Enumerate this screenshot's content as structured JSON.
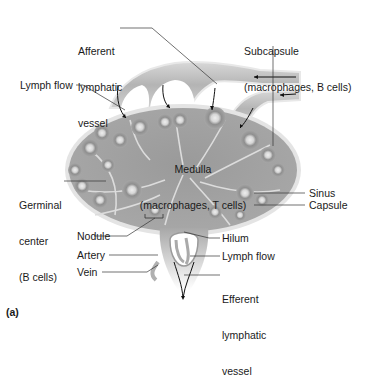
{
  "figure": {
    "panel_label": "(a)"
  },
  "labels": {
    "afferent": [
      "Afferent",
      "lymphatic",
      "vessel"
    ],
    "subcapsule": [
      "Subcapsule",
      "(macrophages, B cells)"
    ],
    "lymph_flow_top": "Lymph flow",
    "medulla": [
      "Medulla",
      "(macrophages, T cells)"
    ],
    "germinal": [
      "Germinal",
      "center",
      "(B cells)"
    ],
    "sinus": "Sinus",
    "capsule": "Capsule",
    "nodule": "Nodule",
    "hilum": "Hilum",
    "artery": "Artery",
    "lymph_flow_bottom": "Lymph flow",
    "vein": "Vein",
    "efferent": [
      "Efferent",
      "lymphatic",
      "vessel"
    ]
  },
  "colors": {
    "tissue_dark": "#8e8e8e",
    "tissue_mid": "#a9a9a9",
    "tissue_light": "#cfcfcf",
    "capsule_edge": "#e6e6e6",
    "nodule_center": "#e2e2e2",
    "leader_line": "#333333",
    "text": "#1a1a1a"
  }
}
